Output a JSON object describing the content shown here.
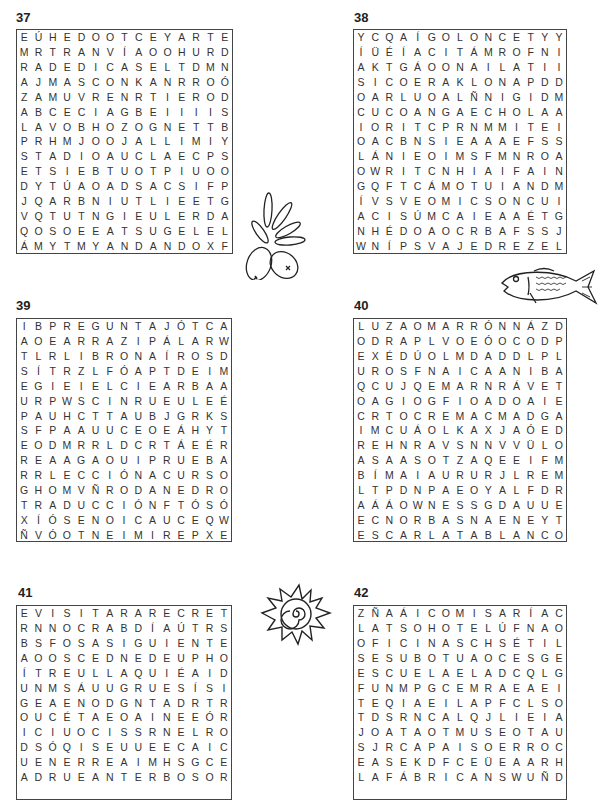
{
  "puzzles": [
    {
      "number": "37",
      "rows": [
        "EÚHEDOOTCEYARTE",
        "MRTRANVÍAOOHURD",
        "RADEDICASELTDMN",
        "AJMASCONKANRROÓ",
        "ZAMUVRENRTIEROD",
        "ABCECIAGBEIIIIS",
        "LAVOBHOZOGNETTB",
        "PRHMJOOJALLIMIY",
        "STADIOAUCLAECPS",
        "ETSIEBTUOTPIUOO",
        "DYTÚAOADSACSIFP",
        "JQARBNIUTLIEETG",
        "VQTUTNGIEULERDA",
        "QOSOEEATSUGELEL",
        "ÁMYTMYANDANDOXF"
      ]
    },
    {
      "number": "38",
      "rows": [
        "YCQAÍGOLONCETYY",
        "ÍÜÉÍACITÁMROFNI",
        "AKTGÁOONAILATII",
        "SICOERAKLONAPDD",
        "OARLUOALÑNIGIDM",
        "CUCOANGAECHOLAA",
        "IORITCPRNMMITEI",
        "OACBNSIEAAAEFSS",
        "LÁNIEOIMSFMNROA",
        "OWRITCNHIAIFAIN",
        "GQFTCÁMOTUIANDM",
        "ÍVSVEOMICSONCUI",
        "ACISÚMCAIEAAÉTG",
        "NHÉDOAOCRBAFSSJ",
        "WNÍPSVAJEDREZEL"
      ]
    },
    {
      "number": "39",
      "rows": [
        "IBPREGUNTAJÓTCA",
        "AOEARRAZIPÁLARW",
        "TLRLIBRONAÍROSD",
        "SÍTRZLFÓAPTDEIM",
        "EGIEIELCIEARBAA",
        "URPWSCINRUEULEÉ",
        "PAUHCTTAUBJGRKS",
        "SFPAAUUCEOEÁHYT",
        "EODMRRLDCRTÁEÉR",
        "REAAGAOUIPRUEBA",
        "RRLECCIÓNACURSO",
        "GHOMVÑRODANEDRO",
        "TRADUCCIÓNFTÓSÓ",
        "XÍÓSENOICAUCEQW",
        "ÑVÓOTNEIMIREPXE"
      ]
    },
    {
      "number": "40",
      "rows": [
        "LUZAOMARRÓNNÁZD",
        "ODRAPLVOEÓOCODP",
        "EXÉDÚOLMDADDLPL",
        "UROSFNAICAANIBA",
        "QCUJQEMARNRÁVET",
        "OAGIOGFIOADOAIE",
        "CRTOCREMACMADGA",
        "IMCUÁOLKAXJAÓED",
        "REHNRAVSNNVVÜLO",
        "ASAASOTZAQEEIFM",
        "BÍMAIAURURJLREM",
        "LTPDNPAEOYALFDR",
        "AÁÁOWNESSGDAUUE",
        "ECNORBASNAENEYT",
        "ESCARLATABLANCO"
      ]
    },
    {
      "number": "41",
      "rows": [
        "EVISITARARECRET",
        "RNNOCRABDÍAÚTRS",
        "BSFOSASIGUIENTE",
        "AOOSCEDNEDEUPHO",
        "ÍTREULLAQUIÉAID",
        "UNMSÁUUGRUESÍSI",
        "GEAENODGNTADRTR",
        "OUCÉTAEOAINEEÓR",
        "ICIUOCISSRNELRO",
        "DSÓQISEUUEECAIC",
        "UENERREAIMHSGCE",
        "ADRUEANTERBOSOR"
      ]
    },
    {
      "number": "42",
      "rows": [
        "ZÑAÁICOMISARÍAC",
        "LATSOHOTELÚFNAO",
        "OFICINASCHSÉTIL",
        "SESUBOTUAOCESGE",
        "ESCUELAELADCQLG",
        "FUNMPGCEMRAEAEI",
        "TEQIAEILAPFCLSO",
        "TDSRNCALQJLIEIA",
        "JOATAOTMUSEOTAU",
        "SJRCAPAISOERROC",
        "EASEKDFCEÜEAARH",
        "LAFÁBRICANSWUÑD"
      ]
    }
  ],
  "decorations": [
    {
      "name": "olive-branch-icon",
      "puzzle_near": "37"
    },
    {
      "name": "fish-icon",
      "puzzle_near": "38"
    },
    {
      "name": "sun-spiral-icon",
      "puzzle_near": "41"
    }
  ]
}
